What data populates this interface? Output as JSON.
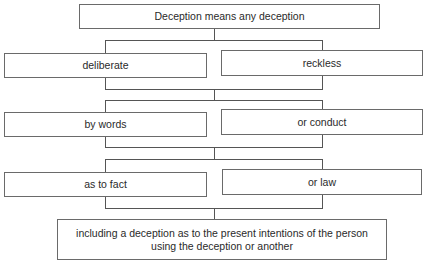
{
  "diagram": {
    "root": {
      "label": "Deception means any deception"
    },
    "levels": [
      {
        "left": "deliberate",
        "right": "reckless"
      },
      {
        "left": "by words",
        "right": "or conduct"
      },
      {
        "left": "as to fact",
        "right": "or law"
      }
    ],
    "conclusion": {
      "label": "including a deception as to the present intentions of the person using the deception or another"
    }
  }
}
